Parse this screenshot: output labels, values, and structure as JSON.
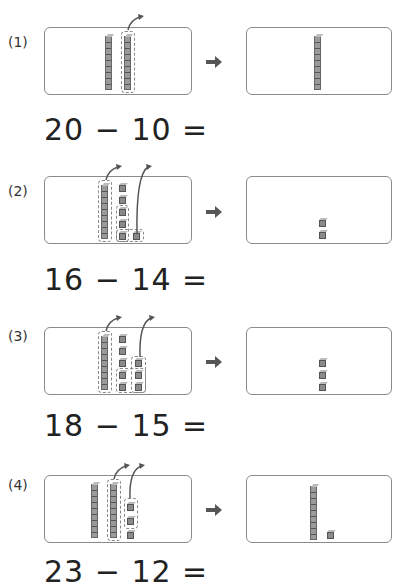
{
  "worksheet": {
    "problems": [
      {
        "label": "(1)",
        "equation": "20 − 10 =",
        "minuend": 20,
        "subtrahend": 10,
        "before": {
          "tens": 2,
          "ones": 0
        },
        "removed": {
          "tens": 1,
          "ones": 0
        },
        "after": {
          "tens": 1,
          "ones": 0
        }
      },
      {
        "label": "(2)",
        "equation": "16 − 14 =",
        "minuend": 16,
        "subtrahend": 14,
        "before": {
          "tens": 1,
          "ones": 6
        },
        "removed": {
          "tens": 1,
          "ones": 4
        },
        "after": {
          "tens": 0,
          "ones": 2
        }
      },
      {
        "label": "(3)",
        "equation": "18 − 15 =",
        "minuend": 18,
        "subtrahend": 15,
        "before": {
          "tens": 1,
          "ones": 8
        },
        "removed": {
          "tens": 1,
          "ones": 5
        },
        "after": {
          "tens": 0,
          "ones": 3
        }
      },
      {
        "label": "(4)",
        "equation": "23 − 12 =",
        "minuend": 23,
        "subtrahend": 12,
        "before": {
          "tens": 2,
          "ones": 3
        },
        "removed": {
          "tens": 1,
          "ones": 2
        },
        "after": {
          "tens": 1,
          "ones": 1
        }
      }
    ],
    "icons": {
      "arrow": "right-arrow-icon",
      "curve": "curved-arrow-icon"
    },
    "colors": {
      "block": "#8a8a8a",
      "border": "#8a8a8a",
      "text": "#222222"
    }
  }
}
